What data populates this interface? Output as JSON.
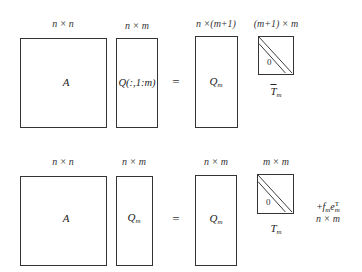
{
  "top_row": {
    "A": {
      "dim": "n × n",
      "label": "A"
    },
    "Q_slice": {
      "dim": "n × m",
      "label_main": "Q(:,1:m)"
    },
    "equals": "=",
    "Qm": {
      "dim": "n ×(m+1)",
      "label_main": "Q",
      "label_sub": "m"
    },
    "Tbar": {
      "dim": "(m+1) × m",
      "zero": "0",
      "label_main": "T",
      "label_sub": "m",
      "overbar": true
    }
  },
  "bottom_row": {
    "A": {
      "dim": "n × n",
      "label": "A"
    },
    "Qm_left": {
      "dim": "n × m",
      "label_main": "Q",
      "label_sub": "m"
    },
    "equals": "=",
    "Qm_right": {
      "dim": "n × m",
      "label_main": "Q",
      "label_sub": "m"
    },
    "T": {
      "dim": "m × m",
      "zero": "0",
      "label_main": "T",
      "label_sub": "m"
    },
    "residual": {
      "plus": "+",
      "f": "f",
      "f_sub": "m",
      "e": "e",
      "e_sub": "m",
      "e_sup": "T",
      "dim": "n × m"
    }
  }
}
